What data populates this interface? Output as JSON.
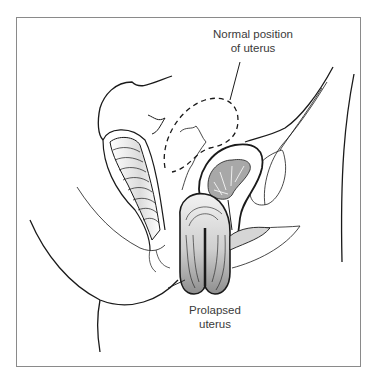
{
  "figure": {
    "labels": {
      "normal_position": {
        "line1": "Normal position",
        "line2": "of uterus"
      },
      "prolapsed": {
        "line1": "Prolapsed",
        "line2": "uterus"
      }
    },
    "colors": {
      "line": "#1a1a1a",
      "frame": "#8a8a8a",
      "organ_fill": "#a8a8a8",
      "label_text": "#3a3a3a"
    }
  }
}
